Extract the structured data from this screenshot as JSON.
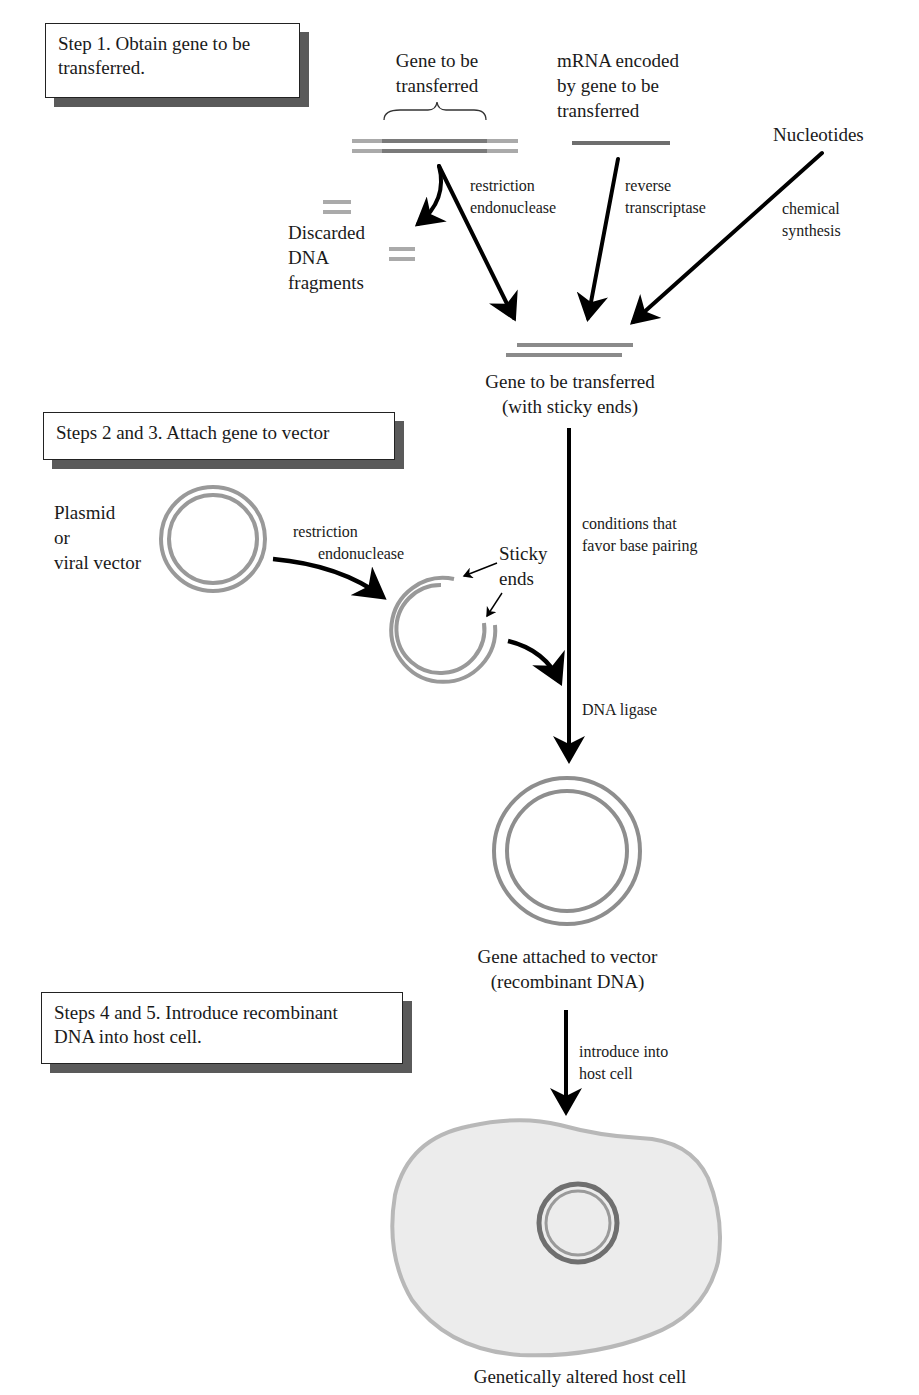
{
  "steps": {
    "step1": {
      "lines": [
        "Step 1. Obtain gene to be",
        "transferred."
      ]
    },
    "step23": {
      "lines": [
        "Steps 2 and 3. Attach gene to vector"
      ]
    },
    "step45": {
      "lines": [
        "Steps 4 and 5. Introduce recombinant",
        "DNA into host cell."
      ]
    }
  },
  "sources": {
    "gene_dna": {
      "lines": [
        "Gene to be",
        "transferred"
      ]
    },
    "mrna": {
      "lines": [
        "mRNA encoded",
        "by gene to be",
        "transferred"
      ]
    },
    "nucleotides": {
      "lines": [
        "Nucleotides"
      ]
    }
  },
  "processes": {
    "restriction_1": {
      "lines": [
        "restriction",
        "endonuclease"
      ]
    },
    "reverse_transcriptase": {
      "lines": [
        "reverse",
        "transcriptase"
      ]
    },
    "chemical_synthesis": {
      "lines": [
        "chemical",
        "synthesis"
      ]
    },
    "base_pairing": {
      "lines": [
        "conditions that",
        "favor base pairing"
      ]
    },
    "restriction_2": {
      "lines": [
        "restriction",
        "endonuclease"
      ]
    },
    "dna_ligase": {
      "lines": [
        "DNA ligase"
      ]
    },
    "introduce": {
      "lines": [
        "introduce into",
        "host cell"
      ]
    }
  },
  "labels": {
    "discarded": {
      "lines": [
        "Discarded",
        "DNA",
        "fragments"
      ]
    },
    "sticky_gene": {
      "lines": [
        "Gene to be transferred",
        "(with sticky ends)"
      ]
    },
    "plasmid": {
      "lines": [
        "Plasmid",
        "or",
        "viral vector"
      ]
    },
    "sticky_ends": {
      "lines": [
        "Sticky",
        "ends"
      ]
    },
    "recombinant": {
      "lines": [
        "Gene attached to vector",
        "(recombinant DNA)"
      ]
    },
    "host_cell": {
      "lines": [
        "Genetically altered host cell"
      ]
    }
  },
  "colors": {
    "dna_light": "#a9a9a9",
    "dna_dark": "#7a7a7a",
    "mrna": "#6e6e6e",
    "arrow": "#000000",
    "cell_fill": "#ececec",
    "cell_border": "#b8b8b8",
    "box_shadow": "#5a5a5a"
  }
}
